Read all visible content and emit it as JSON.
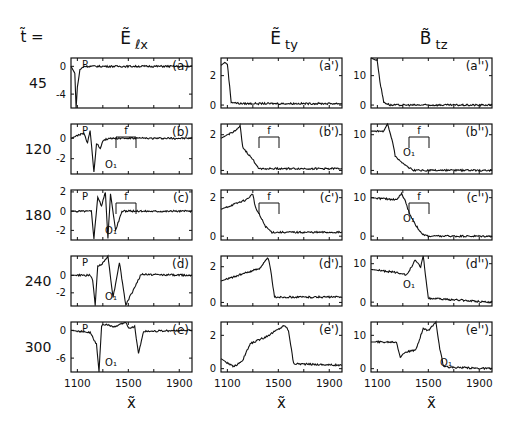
{
  "figure": {
    "t_label": "t̃ =",
    "columns": [
      {
        "title": "Ẽ",
        "sub": "ℓx",
        "id": "Elx"
      },
      {
        "title": "Ẽ",
        "sub": "ty",
        "id": "Ety"
      },
      {
        "title": "B̃",
        "sub": "tz",
        "id": "Btz"
      }
    ],
    "rows": [
      {
        "t": "45"
      },
      {
        "t": "120"
      },
      {
        "t": "180"
      },
      {
        "t": "240"
      },
      {
        "t": "300"
      }
    ],
    "xlabel": "x̃",
    "xticks": [
      "1100",
      "1500",
      "1900"
    ]
  },
  "chart_data": [
    {
      "type": "line",
      "title": "Ẽℓx",
      "panels": [
        {
          "label": "(a)",
          "t": 45,
          "yticks": [
            "0",
            "-4"
          ],
          "ylim": [
            -6,
            1.2
          ],
          "annotations": [
            "P"
          ],
          "x": [
            1050,
            1080,
            1090,
            1100,
            1120,
            1150,
            1200,
            1400,
            1600,
            1800,
            2000
          ],
          "y": [
            0,
            -1,
            -6,
            -3,
            -0.5,
            0,
            0,
            0,
            0,
            0,
            0
          ]
        },
        {
          "label": "(b)",
          "t": 120,
          "yticks": [
            "0",
            "-2"
          ],
          "ylim": [
            -3.5,
            1.4
          ],
          "annotations": [
            "P",
            "O1",
            "f"
          ],
          "x": [
            1050,
            1150,
            1180,
            1200,
            1230,
            1250,
            1280,
            1300,
            1350,
            1400,
            1600,
            2000
          ],
          "y": [
            0,
            0.5,
            -0.5,
            0.8,
            -3.3,
            -0.5,
            -1,
            -0.2,
            0,
            0,
            0,
            0
          ]
        },
        {
          "label": "(c)",
          "t": 180,
          "yticks": [
            "2",
            "0",
            "-2"
          ],
          "ylim": [
            -3,
            2.2
          ],
          "annotations": [
            "P",
            "O1",
            "f"
          ],
          "x": [
            1050,
            1210,
            1230,
            1260,
            1290,
            1320,
            1340,
            1360,
            1400,
            1450,
            1600,
            2000
          ],
          "y": [
            0,
            0,
            -2.8,
            1.5,
            0.5,
            2,
            -2.8,
            1.8,
            -2,
            0,
            0,
            0
          ]
        },
        {
          "label": "(d)",
          "t": 240,
          "yticks": [
            "0",
            "-2"
          ],
          "ylim": [
            -3.5,
            2.2
          ],
          "annotations": [
            "P",
            "O1"
          ],
          "x": [
            1050,
            1200,
            1220,
            1240,
            1260,
            1300,
            1340,
            1380,
            1400,
            1430,
            1480,
            1600,
            2000
          ],
          "y": [
            0,
            0,
            -0.5,
            -3.4,
            1,
            1.4,
            2.2,
            -2.5,
            -1,
            1.5,
            -3.4,
            0.1,
            0
          ]
        },
        {
          "label": "(e)",
          "t": 300,
          "yticks": [
            "0",
            "-6"
          ],
          "ylim": [
            -9,
            1.8
          ],
          "annotations": [
            "P",
            "O1"
          ],
          "x": [
            1050,
            1200,
            1250,
            1270,
            1290,
            1300,
            1400,
            1480,
            1500,
            1550,
            1580,
            1620,
            2000
          ],
          "y": [
            0,
            -0.5,
            -3,
            -9,
            1,
            1.3,
            0.8,
            1.8,
            0.5,
            0.8,
            -5,
            -0.2,
            0
          ]
        }
      ]
    },
    {
      "type": "line",
      "title": "Ẽty",
      "panels": [
        {
          "label": "(a')",
          "t": 45,
          "yticks": [
            "2",
            "0"
          ],
          "ylim": [
            -0.2,
            3.2
          ],
          "x": [
            1050,
            1080,
            1100,
            1130,
            1200,
            2000
          ],
          "y": [
            2.7,
            2.9,
            2.8,
            0.2,
            0.1,
            0.1
          ]
        },
        {
          "label": "(b')",
          "t": 120,
          "yticks": [
            "2",
            "0"
          ],
          "ylim": [
            -0.2,
            2.6
          ],
          "annotations": [
            "f"
          ],
          "x": [
            1050,
            1180,
            1200,
            1220,
            1300,
            1350,
            2000
          ],
          "y": [
            1.8,
            2.3,
            2.5,
            1.3,
            0.6,
            0.1,
            0.1
          ]
        },
        {
          "label": "(c')",
          "t": 180,
          "yticks": [
            "2",
            "0"
          ],
          "ylim": [
            -0.2,
            2.4
          ],
          "annotations": [
            "f"
          ],
          "x": [
            1050,
            1250,
            1300,
            1320,
            1400,
            1450,
            2000
          ],
          "y": [
            1.4,
            1.9,
            2.2,
            1.5,
            0.5,
            0.2,
            0.2
          ]
        },
        {
          "label": "(d')",
          "t": 240,
          "yticks": [
            "2",
            "0"
          ],
          "ylim": [
            -0.2,
            2.6
          ],
          "x": [
            1050,
            1350,
            1420,
            1440,
            1470,
            2000
          ],
          "y": [
            1.2,
            1.9,
            2.5,
            1.8,
            0.3,
            0.3
          ]
        },
        {
          "label": "(e')",
          "t": 300,
          "yticks": [
            "2",
            "0"
          ],
          "ylim": [
            -0.2,
            2.8
          ],
          "x": [
            1050,
            1150,
            1220,
            1280,
            1400,
            1550,
            1580,
            1620,
            2000
          ],
          "y": [
            0.6,
            0.1,
            0.5,
            1.5,
            1.9,
            2.6,
            2.3,
            0.3,
            0.2
          ]
        }
      ]
    },
    {
      "type": "line",
      "title": "B̃tz",
      "panels": [
        {
          "label": "(a'')",
          "t": 45,
          "yticks": [
            "10",
            "0"
          ],
          "ylim": [
            -1,
            16
          ],
          "x": [
            1050,
            1100,
            1120,
            1150,
            1200,
            2000
          ],
          "y": [
            16,
            15,
            8,
            1,
            0,
            0
          ]
        },
        {
          "label": "(b'')",
          "t": 120,
          "yticks": [
            "10",
            "0"
          ],
          "ylim": [
            -1,
            13
          ],
          "annotations": [
            "O1",
            "f"
          ],
          "x": [
            1050,
            1150,
            1180,
            1220,
            1240,
            1300,
            1380,
            2000
          ],
          "y": [
            11,
            11,
            13,
            8,
            4,
            2,
            0,
            0
          ]
        },
        {
          "label": "(c'')",
          "t": 180,
          "yticks": [
            "10",
            "0"
          ],
          "ylim": [
            -1,
            12
          ],
          "annotations": [
            "O1",
            "f"
          ],
          "x": [
            1050,
            1250,
            1290,
            1320,
            1350,
            1400,
            1450,
            1500,
            2000
          ],
          "y": [
            10,
            9.5,
            11,
            9,
            6,
            3,
            0.5,
            0,
            0
          ]
        },
        {
          "label": "(d'')",
          "t": 240,
          "yticks": [
            "10",
            "0"
          ],
          "ylim": [
            -1,
            12
          ],
          "annotations": [
            "O1"
          ],
          "x": [
            1050,
            1300,
            1330,
            1400,
            1440,
            1460,
            1500,
            2000
          ],
          "y": [
            8.5,
            7.5,
            7,
            11,
            9,
            12,
            1,
            0
          ]
        },
        {
          "label": "(e'')",
          "t": 300,
          "yticks": [
            "10",
            "0"
          ],
          "ylim": [
            -1,
            14
          ],
          "annotations": [
            "O1"
          ],
          "x": [
            1050,
            1250,
            1280,
            1320,
            1400,
            1460,
            1500,
            1560,
            1590,
            1620,
            2000
          ],
          "y": [
            8,
            8,
            3.5,
            5,
            5.5,
            12,
            11.5,
            14,
            6,
            0.5,
            0
          ]
        }
      ]
    }
  ]
}
